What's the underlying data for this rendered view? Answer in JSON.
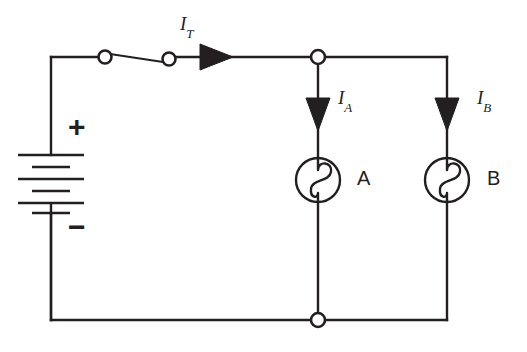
{
  "diagram": {
    "stroke_color": "#231f20",
    "background_color": "#ffffff"
  },
  "source": {
    "type": "battery",
    "polarity_plus": "+",
    "polarity_minus": "−",
    "cells": 3
  },
  "switch": {
    "name": "switch",
    "state": "closed"
  },
  "currents": [
    {
      "id": "total",
      "symbol": "I",
      "subscript": "T",
      "direction": "right",
      "branch": "main"
    },
    {
      "id": "branch_a",
      "symbol": "I",
      "subscript": "A",
      "direction": "down",
      "branch": "A"
    },
    {
      "id": "branch_b",
      "symbol": "I",
      "subscript": "B",
      "direction": "down",
      "branch": "B"
    }
  ],
  "lamps": [
    {
      "id": "lamp_a",
      "label": "A",
      "symbol": "lamp"
    },
    {
      "id": "lamp_b",
      "label": "B",
      "symbol": "lamp"
    }
  ],
  "nodes": [
    {
      "id": "top_junction",
      "type": "junction"
    },
    {
      "id": "bottom_junction",
      "type": "junction"
    }
  ]
}
